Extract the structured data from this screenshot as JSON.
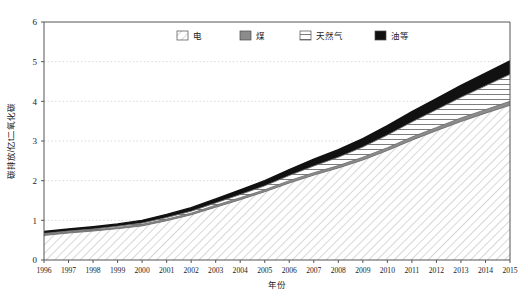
{
  "chart_data": {
    "type": "area",
    "stacked": true,
    "title": "",
    "xlabel": "年份",
    "ylabel": "碳排放/亿t二氧化碳",
    "xlim": [
      1996,
      2015
    ],
    "ylim": [
      0,
      6
    ],
    "yticks": [
      0,
      1,
      2,
      3,
      4,
      5,
      6
    ],
    "grid": "horizontal-dotted",
    "legend_position": "top-center",
    "categories": [
      "1996",
      "1997",
      "1998",
      "1999",
      "2000",
      "2001",
      "2002",
      "2003",
      "2004",
      "2005",
      "2006",
      "2007",
      "2008",
      "2009",
      "2010",
      "2011",
      "2012",
      "2013",
      "2014",
      "2015"
    ],
    "series": [
      {
        "name": "电",
        "pattern": "diagonal-hatch",
        "color": "#ffffff",
        "values": [
          0.62,
          0.68,
          0.73,
          0.79,
          0.86,
          0.99,
          1.14,
          1.33,
          1.52,
          1.72,
          1.94,
          2.14,
          2.32,
          2.52,
          2.76,
          3.02,
          3.26,
          3.49,
          3.7,
          3.9
        ]
      },
      {
        "name": "煤",
        "pattern": "solid-gray",
        "color": "#8c8c8c",
        "values": [
          0.03,
          0.03,
          0.03,
          0.03,
          0.04,
          0.04,
          0.04,
          0.05,
          0.05,
          0.05,
          0.06,
          0.06,
          0.06,
          0.07,
          0.07,
          0.08,
          0.08,
          0.09,
          0.09,
          0.1
        ]
      },
      {
        "name": "天然气",
        "pattern": "horizontal-lines",
        "color": "#ffffff",
        "values": [
          0.02,
          0.02,
          0.02,
          0.03,
          0.03,
          0.04,
          0.05,
          0.06,
          0.08,
          0.1,
          0.13,
          0.17,
          0.21,
          0.26,
          0.32,
          0.38,
          0.45,
          0.52,
          0.6,
          0.68
        ]
      },
      {
        "name": "油等",
        "pattern": "solid-black",
        "color": "#111111",
        "values": [
          0.05,
          0.05,
          0.06,
          0.06,
          0.07,
          0.08,
          0.09,
          0.1,
          0.12,
          0.13,
          0.15,
          0.17,
          0.19,
          0.21,
          0.24,
          0.26,
          0.28,
          0.3,
          0.32,
          0.34
        ]
      }
    ],
    "totals": [
      0.72,
      0.78,
      0.84,
      0.91,
      1.0,
      1.15,
      1.32,
      1.54,
      1.77,
      2.0,
      2.28,
      2.54,
      2.78,
      3.06,
      3.39,
      3.74,
      4.07,
      4.4,
      4.71,
      5.02
    ]
  },
  "legend": {
    "items": [
      {
        "label": "电",
        "swatch": "diagonal-hatch"
      },
      {
        "label": "煤",
        "swatch": "solid-gray"
      },
      {
        "label": "天然气",
        "swatch": "horizontal-lines"
      },
      {
        "label": "油等",
        "swatch": "solid-black"
      }
    ]
  },
  "axes": {
    "y_title": "碳排放/亿t二氧化碳",
    "x_title": "年份",
    "y_labels": [
      "6",
      "5",
      "4",
      "3",
      "2",
      "1",
      "0"
    ],
    "x_labels": [
      "1996",
      "1997",
      "1998",
      "1999",
      "2000",
      "2001",
      "2002",
      "2003",
      "2004",
      "2005",
      "2006",
      "2007",
      "2008",
      "2009",
      "2010",
      "2011",
      "2012",
      "2013",
      "2014",
      "2015"
    ]
  },
  "colors": {
    "axis": "#555555",
    "grid": "#cfcfcf",
    "coal": "#8c8c8c",
    "oil": "#111111",
    "hatch": "#9a9a9a",
    "text": "#1a1a1a"
  }
}
